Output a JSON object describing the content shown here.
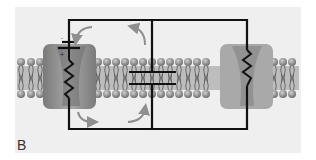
{
  "figure": {
    "panel_label": "B",
    "components": [
      "membrane-bilayer",
      "ion-channel-with-battery-and-resistor",
      "membrane-capacitor",
      "leak-channel-with-resistor",
      "current-flow-arrows"
    ],
    "battery_signs": {
      "negative": "-",
      "positive": "+"
    }
  },
  "colors": {
    "background": "#efefef",
    "circuit": "#111111",
    "channel": "#8a8a8a",
    "head": "#8c8c8c",
    "arrow": "#8f8f8f"
  }
}
